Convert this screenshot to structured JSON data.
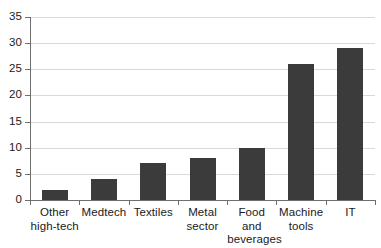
{
  "chart_data": {
    "type": "bar",
    "title": "",
    "subtitle": "",
    "xlabel": "",
    "ylabel": "",
    "categories": [
      "Other\nhigh-tech",
      "Medtech",
      "Textiles",
      "Metal\nsector",
      "Food and\nbeverages",
      "Machine\ntools",
      "IT"
    ],
    "values": [
      2,
      4,
      7,
      8,
      10,
      26,
      29
    ],
    "ylim": [
      0,
      35
    ],
    "ytick_labels": [
      "35",
      "30",
      "25",
      "20",
      "15",
      "10",
      "5",
      "0"
    ],
    "ytick_values": [
      35,
      30,
      25,
      20,
      15,
      10,
      5,
      0
    ],
    "grid": true,
    "grid_axis": "y",
    "legend": null,
    "bar_color": "#3b3b3b",
    "grid_color": "#d9d9d9",
    "axis_color": "#6e6e6e",
    "background_color": "#ffffff"
  }
}
